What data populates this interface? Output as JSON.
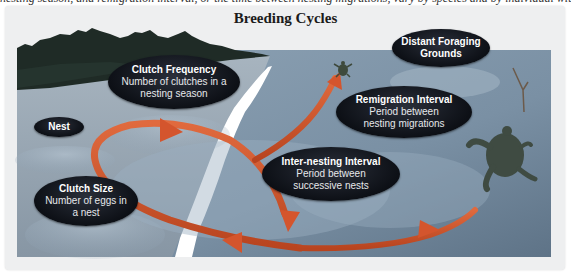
{
  "figure": {
    "title": "Breeding Cycles",
    "top_cut_text": "nesting season, and remigration interval, or the time between nesting migrations, vary by species and by individual within a species."
  },
  "labels": {
    "nest": {
      "heading": "Nest"
    },
    "clutch_frequency": {
      "heading": "Clutch Frequency",
      "line1": "Number of clutches in a",
      "line2": "nesting season"
    },
    "clutch_size": {
      "heading": "Clutch Size",
      "line1": "Number of eggs in",
      "line2": "a nest"
    },
    "inter_nesting": {
      "heading": "Inter-nesting Interval",
      "line1": "Period between",
      "line2": "successive nests"
    },
    "remigration": {
      "heading": "Remigration Interval",
      "line1": "Period between",
      "line2": "nesting migrations"
    },
    "foraging": {
      "heading": "Distant Foraging",
      "line2": "Grounds"
    }
  },
  "colors": {
    "water": "#7f95a8",
    "water_dark": "#5d7388",
    "beach": "#9aa9b6",
    "trees": "#1f2a24",
    "arrow": "#d4552d",
    "arrow_dark": "#a83b1e",
    "shoreline": "#ffffff",
    "label_bg": "#0d1016"
  }
}
